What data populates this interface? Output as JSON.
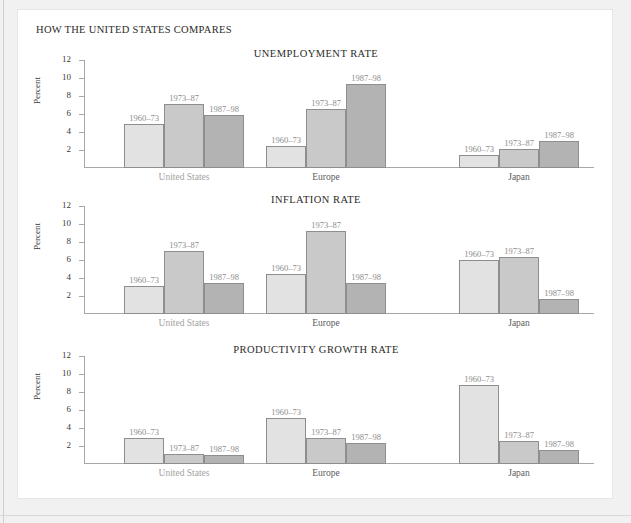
{
  "panel": {
    "header": "HOW THE UNITED STATES COMPARES"
  },
  "axis": {
    "ylabel": "Percent",
    "ticks": [
      "12",
      "10",
      "8",
      "6",
      "4",
      "2"
    ]
  },
  "groups": [
    {
      "key": "us",
      "label": "United States"
    },
    {
      "key": "eu",
      "label": "Europe"
    },
    {
      "key": "jp",
      "label": "Japan"
    }
  ],
  "series": [
    "1960–73",
    "1973–87",
    "1987–98"
  ],
  "colors": {
    "series_1": "#e2e2e2",
    "series_2": "#c9c9c9",
    "series_3": "#b3b3b3",
    "bar_border": "#8e8e8e",
    "axis": "#a8a8a8",
    "panel_bg": "#ffffff",
    "page_bg": "#f1f1f1",
    "title_text": "#2c2a28",
    "bar_label_text": "#8d8d8d"
  },
  "chart_data": [
    {
      "type": "bar",
      "title": "UNEMPLOYMENT RATE",
      "xlabel": "",
      "ylabel": "Percent",
      "ylim": [
        0,
        12
      ],
      "yticks": [
        2,
        4,
        6,
        8,
        10,
        12
      ],
      "grid": false,
      "legend": "none (period labels above bars)",
      "categories": [
        "United States",
        "Europe",
        "Japan"
      ],
      "series": [
        {
          "name": "1960–73",
          "values": [
            4.9,
            2.4,
            1.4
          ]
        },
        {
          "name": "1973–87",
          "values": [
            7.1,
            6.6,
            2.1
          ]
        },
        {
          "name": "1987–98",
          "values": [
            5.9,
            9.3,
            3.0
          ]
        }
      ]
    },
    {
      "type": "bar",
      "title": "INFLATION RATE",
      "xlabel": "",
      "ylabel": "Percent",
      "ylim": [
        0,
        12
      ],
      "yticks": [
        2,
        4,
        6,
        8,
        10,
        12
      ],
      "grid": false,
      "legend": "none (period labels above bars)",
      "categories": [
        "United States",
        "Europe",
        "Japan"
      ],
      "series": [
        {
          "name": "1960–73",
          "values": [
            3.1,
            4.5,
            6.0
          ]
        },
        {
          "name": "1973–87",
          "values": [
            7.0,
            9.2,
            6.3
          ]
        },
        {
          "name": "1987–98",
          "values": [
            3.5,
            3.5,
            1.7
          ]
        }
      ]
    },
    {
      "type": "bar",
      "title": "PRODUCTIVITY GROWTH RATE",
      "xlabel": "",
      "ylabel": "Percent",
      "ylim": [
        0,
        12
      ],
      "yticks": [
        2,
        4,
        6,
        8,
        10,
        12
      ],
      "grid": false,
      "legend": "none (period labels above bars)",
      "categories": [
        "United States",
        "Europe",
        "Japan"
      ],
      "series": [
        {
          "name": "1960–73",
          "values": [
            2.9,
            5.1,
            8.8
          ]
        },
        {
          "name": "1973–87",
          "values": [
            1.1,
            2.9,
            2.6
          ]
        },
        {
          "name": "1987–98",
          "values": [
            1.0,
            2.3,
            1.6
          ]
        }
      ]
    }
  ]
}
